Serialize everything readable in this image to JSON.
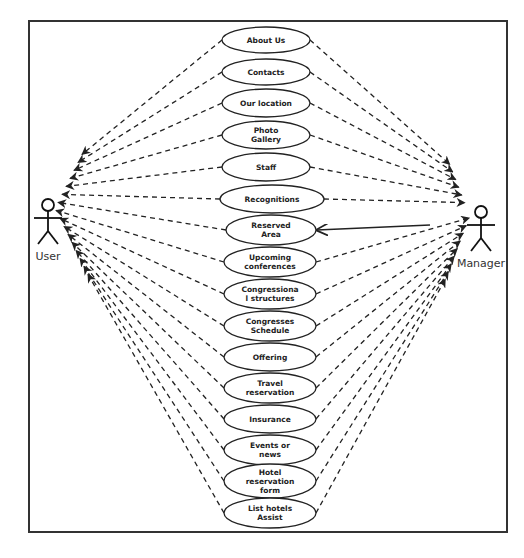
{
  "diagram": {
    "type": "use-case",
    "frame": {
      "x": 29,
      "y": 21,
      "width": 478,
      "height": 511
    },
    "actors": [
      {
        "id": "user",
        "label": "User",
        "x": 48,
        "y": 205
      },
      {
        "id": "manager",
        "label": "Manager",
        "x": 481,
        "y": 212
      }
    ],
    "use_cases": [
      {
        "id": "about-us",
        "lines": [
          "About Us"
        ],
        "cx": 266,
        "cy": 40,
        "rx": 44,
        "ry": 13
      },
      {
        "id": "contacts",
        "lines": [
          "Contacts"
        ],
        "cx": 266,
        "cy": 72,
        "rx": 44,
        "ry": 13
      },
      {
        "id": "our-location",
        "lines": [
          "Our location"
        ],
        "cx": 266,
        "cy": 103,
        "rx": 44,
        "ry": 14
      },
      {
        "id": "photo-gallery",
        "lines": [
          "Photo",
          "Gallery"
        ],
        "cx": 266,
        "cy": 135,
        "rx": 44,
        "ry": 14
      },
      {
        "id": "staff",
        "lines": [
          "Staff"
        ],
        "cx": 266,
        "cy": 167,
        "rx": 44,
        "ry": 14
      },
      {
        "id": "recognitions",
        "lines": [
          "Recognitions"
        ],
        "cx": 272,
        "cy": 199,
        "rx": 52,
        "ry": 14
      },
      {
        "id": "reserved-area",
        "lines": [
          "Reserved",
          "Area"
        ],
        "cx": 271,
        "cy": 230,
        "rx": 45,
        "ry": 15
      },
      {
        "id": "upcoming-conferences",
        "lines": [
          "Upcoming",
          "conferences"
        ],
        "cx": 270,
        "cy": 262,
        "rx": 46,
        "ry": 15
      },
      {
        "id": "congressional-structures",
        "lines": [
          "Congressiona",
          "l structures"
        ],
        "cx": 270,
        "cy": 294,
        "rx": 46,
        "ry": 15
      },
      {
        "id": "congresses-schedule",
        "lines": [
          "Congresses",
          "Schedule"
        ],
        "cx": 270,
        "cy": 326,
        "rx": 46,
        "ry": 15
      },
      {
        "id": "offering",
        "lines": [
          "Offering"
        ],
        "cx": 270,
        "cy": 357,
        "rx": 46,
        "ry": 14
      },
      {
        "id": "travel-reservation",
        "lines": [
          "Travel",
          "reservation"
        ],
        "cx": 270,
        "cy": 388,
        "rx": 46,
        "ry": 15
      },
      {
        "id": "insurance",
        "lines": [
          "Insurance"
        ],
        "cx": 270,
        "cy": 419,
        "rx": 46,
        "ry": 14
      },
      {
        "id": "events-or-news",
        "lines": [
          "Events or",
          "news"
        ],
        "cx": 270,
        "cy": 450,
        "rx": 46,
        "ry": 15
      },
      {
        "id": "hotel-reservation-form",
        "lines": [
          "Hotel",
          "reservation",
          "form"
        ],
        "cx": 270,
        "cy": 481,
        "rx": 46,
        "ry": 17
      },
      {
        "id": "list-hotels-assist",
        "lines": [
          "List hotels",
          "Assist"
        ],
        "cx": 270,
        "cy": 513,
        "rx": 46,
        "ry": 15
      }
    ],
    "associations": {
      "dashed_to_user": "all use cases",
      "dashed_to_manager": "all use cases except reserved-area",
      "solid_manager_to": "reserved-area"
    },
    "colors": {
      "line": "#222222",
      "frame": "#333333",
      "background": "#ffffff"
    }
  }
}
